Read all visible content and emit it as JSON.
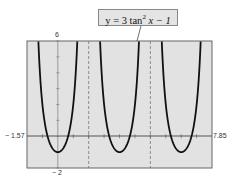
{
  "chart_data": {
    "type": "line",
    "title": "",
    "equation_label": {
      "prefix": "y = 3 tan",
      "exponent": "2",
      "suffix": " x − 1"
    },
    "function": "y = 3*tan(x)^2 - 1",
    "xlabel": "",
    "ylabel": "",
    "xlim": [
      -1.57,
      7.85
    ],
    "ylim": [
      -2,
      6
    ],
    "tick_labels": {
      "xmin": "− 1.57",
      "xmax": "7.85",
      "ymax": "6",
      "ymin": "− 2"
    },
    "x_tick_step": 0.785,
    "y_tick_step": 1,
    "asymptotes": [
      1.5708,
      4.7124
    ],
    "minima": [
      {
        "x": 0,
        "y": -1
      },
      {
        "x": 3.1416,
        "y": -1
      },
      {
        "x": 6.2832,
        "y": -1
      }
    ],
    "grid": false,
    "legend": null,
    "colors": {
      "plot_bg": "#e2e2e2",
      "curve": "#111111",
      "asymptote": "#777777",
      "axis": "#555555",
      "frame": "#666666"
    }
  }
}
